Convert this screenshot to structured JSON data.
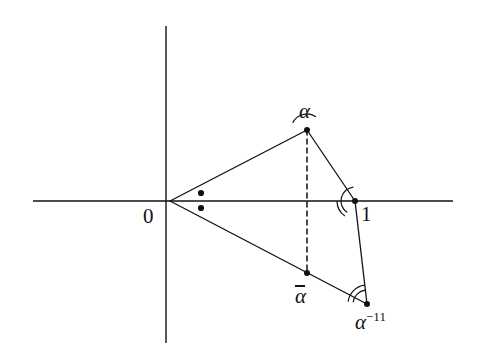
{
  "figure": {
    "kind": "geometry-diagram",
    "background_color": "#ffffff",
    "ink_color": "#111111"
  },
  "axes": {
    "real_axis": {
      "name": "real-axis",
      "x1": 33,
      "y1": 201,
      "x2": 453,
      "y2": 201,
      "stroke_width": 1.4
    },
    "imaginary_axis": {
      "name": "imaginary-axis",
      "x1": 166,
      "y1": 26,
      "x2": 166,
      "y2": 343,
      "stroke_width": 1.4
    }
  },
  "points": [
    {
      "id": "origin",
      "label": "0",
      "x": 170,
      "y": 201,
      "dot": false,
      "label_x": 143,
      "label_y": 206,
      "label_style": "num",
      "label_size": "lg"
    },
    {
      "id": "alpha",
      "label": "α",
      "x": 307,
      "y": 130,
      "dot": true,
      "label_x": 299,
      "label_y": 101,
      "label_style": "math",
      "label_size": "lg"
    },
    {
      "id": "one",
      "label": "1",
      "x": 355,
      "y": 201,
      "dot": true,
      "label_x": 361,
      "label_y": 204,
      "label_style": "num",
      "label_size": "lg"
    },
    {
      "id": "alpha-bar",
      "label": "α",
      "x": 307,
      "y": 273,
      "dot": true,
      "label_x": 295,
      "label_y": 284,
      "label_style": "math",
      "label_size": "lg",
      "overbar": true
    },
    {
      "id": "alpha-inverse",
      "label": "α",
      "x": 367,
      "y": 304,
      "dot": true,
      "label_x": 355,
      "label_y": 310,
      "label_style": "math",
      "label_size": "lg",
      "superscript": "−1"
    }
  ],
  "marker_dots": [
    {
      "id": "angle-dot-upper",
      "x": 201,
      "y": 193,
      "r": 3.1
    },
    {
      "id": "angle-dot-lower",
      "x": 201,
      "y": 208,
      "r": 3.1
    }
  ],
  "segments": [
    {
      "id": "origin-to-alpha",
      "x1": 170,
      "y1": 201,
      "x2": 307,
      "y2": 130,
      "style": "solid",
      "stroke_width": 1.3
    },
    {
      "id": "origin-to-alpha-inverse",
      "x1": 170,
      "y1": 201,
      "x2": 367,
      "y2": 304,
      "style": "solid",
      "stroke_width": 1.3
    },
    {
      "id": "alpha-to-one",
      "x1": 307,
      "y1": 130,
      "x2": 355,
      "y2": 201,
      "style": "solid",
      "stroke_width": 1.3
    },
    {
      "id": "one-to-alpha-inverse",
      "x1": 355,
      "y1": 201,
      "x2": 367,
      "y2": 304,
      "style": "solid",
      "stroke_width": 1.3
    },
    {
      "id": "alpha-to-alpha-bar",
      "x1": 307,
      "y1": 130,
      "x2": 307,
      "y2": 273,
      "style": "dashed",
      "stroke_width": 1.5,
      "dash": "5,4"
    }
  ],
  "angle_arcs": [
    {
      "id": "arc-at-alpha",
      "cx": 307,
      "cy": 130,
      "r": 16,
      "start_deg": 207,
      "end_deg": 304,
      "arcs": 1
    },
    {
      "id": "arc-at-one",
      "cx": 355,
      "cy": 201,
      "r": 14,
      "start_deg": 124,
      "end_deg": 263,
      "arcs": 1
    },
    {
      "id": "arc-at-one-outer",
      "cx": 355,
      "cy": 201,
      "r": 18,
      "start_deg": 124,
      "end_deg": 180,
      "arcs": 1
    },
    {
      "id": "arc-at-alpha-inverse-inner",
      "cx": 367,
      "cy": 304,
      "r": 14,
      "start_deg": 187,
      "end_deg": 263,
      "arcs": 1
    },
    {
      "id": "arc-at-alpha-inverse-outer",
      "cx": 367,
      "cy": 304,
      "r": 19,
      "start_deg": 187,
      "end_deg": 263,
      "arcs": 1
    }
  ]
}
